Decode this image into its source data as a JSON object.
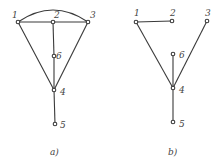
{
  "colors": {
    "stroke": "#3a3a3a",
    "text": "#444444",
    "background": "#ffffff"
  },
  "graphs": [
    {
      "caption": "a)",
      "nodes": [
        {
          "id": "1",
          "label": "1",
          "x": 18,
          "y": 22
        },
        {
          "id": "2",
          "label": "2",
          "x": 53,
          "y": 22
        },
        {
          "id": "3",
          "label": "3",
          "x": 88,
          "y": 22
        },
        {
          "id": "6",
          "label": "6",
          "x": 54,
          "y": 56
        },
        {
          "id": "4",
          "label": "4",
          "x": 54,
          "y": 90
        },
        {
          "id": "5",
          "label": "5",
          "x": 55,
          "y": 124
        }
      ],
      "edges": [
        [
          "1",
          "2"
        ],
        [
          "2",
          "3"
        ],
        [
          "1",
          "3",
          "arc"
        ],
        [
          "2",
          "6"
        ],
        [
          "6",
          "4"
        ],
        [
          "1",
          "4"
        ],
        [
          "3",
          "4"
        ],
        [
          "4",
          "5"
        ]
      ]
    },
    {
      "caption": "b)",
      "nodes": [
        {
          "id": "1",
          "label": "1",
          "x": 136,
          "y": 22
        },
        {
          "id": "2",
          "label": "2",
          "x": 172,
          "y": 21
        },
        {
          "id": "3",
          "label": "3",
          "x": 207,
          "y": 21
        },
        {
          "id": "6",
          "label": "6",
          "x": 173,
          "y": 54
        },
        {
          "id": "4",
          "label": "4",
          "x": 173,
          "y": 88
        },
        {
          "id": "5",
          "label": "5",
          "x": 173,
          "y": 122
        }
      ],
      "edges": [
        [
          "1",
          "2"
        ],
        [
          "1",
          "4"
        ],
        [
          "3",
          "4"
        ],
        [
          "6",
          "4"
        ],
        [
          "4",
          "5"
        ]
      ]
    }
  ]
}
